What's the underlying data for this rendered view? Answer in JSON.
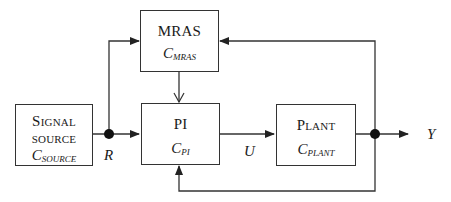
{
  "diagram": {
    "blocks": {
      "signal_source": {
        "title_line1": "Signal",
        "title_line2": "source",
        "symbol": "C",
        "symbol_sub": "SOURCE"
      },
      "mras": {
        "title": "MRAS",
        "symbol": "C",
        "symbol_sub": "MRAS"
      },
      "pi": {
        "title": "PI",
        "symbol": "C",
        "symbol_sub": "PI"
      },
      "plant": {
        "title": "Plant",
        "symbol": "C",
        "symbol_sub": "PLANT"
      }
    },
    "signals": {
      "r": "R",
      "u": "U",
      "y": "Y"
    },
    "colors": {
      "line": "#333333",
      "text": "#1a1a1a",
      "background": "#ffffff"
    }
  }
}
